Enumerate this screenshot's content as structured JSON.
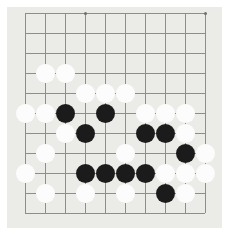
{
  "app": {
    "title": "Go Board",
    "kind": "go-board-image"
  },
  "board": {
    "label": "Go board",
    "background_color": "#ebebe7",
    "page_background_color": "#ffffff",
    "line_color": "#8d8d8d",
    "star_point_color": "#6e6e6e",
    "black_stone_color": "#1b1b1b",
    "white_stone_color": "#fcfcfc",
    "panel": {
      "left": 7,
      "top": 7,
      "width": 215,
      "height": 221
    },
    "origin": {
      "x": 25,
      "y": 13
    },
    "spacing": 20,
    "columns": 10,
    "rows": 11,
    "stone_diameter": 19,
    "star_points": [
      {
        "col": 3,
        "row": 0
      },
      {
        "col": 9,
        "row": 0
      }
    ],
    "stones": [
      {
        "color": "white",
        "col": 1,
        "row": 3
      },
      {
        "color": "white",
        "col": 2,
        "row": 3
      },
      {
        "color": "white",
        "col": 3,
        "row": 4
      },
      {
        "color": "white",
        "col": 4,
        "row": 4
      },
      {
        "color": "white",
        "col": 5,
        "row": 4
      },
      {
        "color": "white",
        "col": 0,
        "row": 5
      },
      {
        "color": "white",
        "col": 1,
        "row": 5
      },
      {
        "color": "black",
        "col": 2,
        "row": 5
      },
      {
        "color": "black",
        "col": 4,
        "row": 5
      },
      {
        "color": "white",
        "col": 6,
        "row": 5
      },
      {
        "color": "white",
        "col": 7,
        "row": 5
      },
      {
        "color": "white",
        "col": 8,
        "row": 5
      },
      {
        "color": "white",
        "col": 2,
        "row": 6
      },
      {
        "color": "black",
        "col": 3,
        "row": 6
      },
      {
        "color": "black",
        "col": 6,
        "row": 6
      },
      {
        "color": "black",
        "col": 7,
        "row": 6
      },
      {
        "color": "white",
        "col": 8,
        "row": 6
      },
      {
        "color": "white",
        "col": 1,
        "row": 7
      },
      {
        "color": "white",
        "col": 5,
        "row": 7
      },
      {
        "color": "black",
        "col": 8,
        "row": 7
      },
      {
        "color": "white",
        "col": 9,
        "row": 7
      },
      {
        "color": "white",
        "col": 0,
        "row": 8
      },
      {
        "color": "black",
        "col": 3,
        "row": 8
      },
      {
        "color": "black",
        "col": 4,
        "row": 8
      },
      {
        "color": "black",
        "col": 5,
        "row": 8
      },
      {
        "color": "black",
        "col": 6,
        "row": 8
      },
      {
        "color": "white",
        "col": 7,
        "row": 8
      },
      {
        "color": "white",
        "col": 8,
        "row": 8
      },
      {
        "color": "white",
        "col": 9,
        "row": 8
      },
      {
        "color": "white",
        "col": 1,
        "row": 9
      },
      {
        "color": "white",
        "col": 3,
        "row": 9
      },
      {
        "color": "white",
        "col": 5,
        "row": 9
      },
      {
        "color": "black",
        "col": 7,
        "row": 9
      },
      {
        "color": "white",
        "col": 8,
        "row": 9
      }
    ]
  }
}
